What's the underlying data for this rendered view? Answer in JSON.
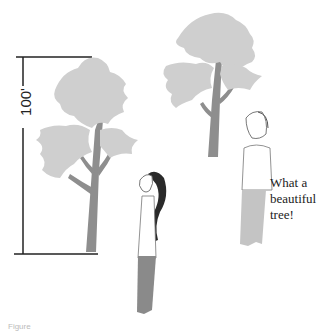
{
  "figure": {
    "measurement": {
      "label": "100'",
      "orientation": "vertical"
    },
    "speech_bubble": {
      "lines": [
        "What a",
        "beautiful",
        "tree!"
      ]
    },
    "elements": {
      "tall_tree": "tree-near",
      "far_tree": "tree-far",
      "person_near": "woman-looking-up",
      "person_far": "man-looking-up"
    },
    "colors": {
      "foliage": "#cfcfcf",
      "trunk": "#8e8e8e",
      "hair": "#2a2a2a",
      "pants": "#8a8a8a",
      "pants_far": "#c4c4c4",
      "line": "#222222"
    },
    "caption": "Figure"
  }
}
